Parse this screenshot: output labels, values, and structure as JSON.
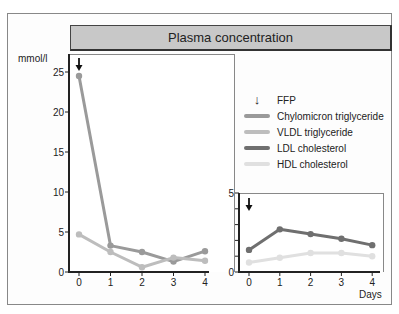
{
  "title": "Plasma concentration",
  "y_unit": "mmol/l",
  "x_label": "Days",
  "legend": [
    {
      "label": "FFP",
      "kind": "arrow",
      "color": "#111111"
    },
    {
      "label": "Chylomicron triglyceride",
      "kind": "line",
      "color": "#9a9a9a"
    },
    {
      "label": "VLDL triglyceride",
      "kind": "line",
      "color": "#bdbdbd"
    },
    {
      "label": "LDL cholesterol",
      "kind": "line",
      "color": "#6f6f6f"
    },
    {
      "label": "HDL cholesterol",
      "kind": "line",
      "color": "#e0e0e0"
    }
  ],
  "chart_data": [
    {
      "type": "line",
      "title": "Plasma concentration",
      "ylabel": "mmol/l",
      "xlabel": "",
      "x": [
        0,
        1,
        2,
        3,
        4
      ],
      "ylim": [
        0,
        25
      ],
      "yticks": [
        0,
        5,
        10,
        15,
        20,
        25
      ],
      "annotations": [
        {
          "type": "arrow",
          "label": "FFP",
          "x": 0
        }
      ],
      "series": [
        {
          "name": "Chylomicron triglyceride",
          "color": "#9a9a9a",
          "values": [
            24.5,
            3.3,
            2.5,
            1.3,
            2.6
          ]
        },
        {
          "name": "VLDL triglyceride",
          "color": "#bdbdbd",
          "values": [
            4.7,
            2.5,
            0.6,
            1.8,
            1.4
          ]
        }
      ],
      "grid": false
    },
    {
      "type": "line",
      "xlabel": "Days",
      "ylabel": "mmol/l",
      "x": [
        0,
        1,
        2,
        3,
        4
      ],
      "ylim": [
        0,
        5
      ],
      "yticks": [
        0,
        5
      ],
      "annotations": [
        {
          "type": "arrow",
          "label": "FFP",
          "x": 0
        }
      ],
      "series": [
        {
          "name": "LDL cholesterol",
          "color": "#6f6f6f",
          "values": [
            1.4,
            2.7,
            2.4,
            2.1,
            1.7
          ]
        },
        {
          "name": "HDL cholesterol",
          "color": "#e0e0e0",
          "values": [
            0.6,
            0.9,
            1.2,
            1.2,
            1.0
          ]
        }
      ],
      "grid": false
    }
  ]
}
